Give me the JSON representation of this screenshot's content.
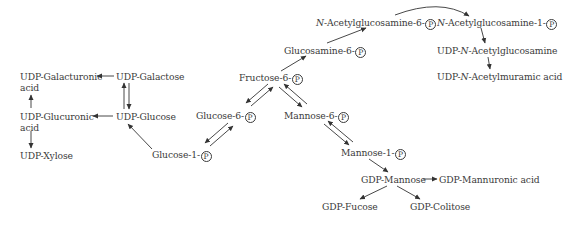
{
  "diagram": {
    "title": "",
    "phosphate_symbol": "P",
    "nodes": {
      "udp_galacturonic": {
        "line1": "UDP-Galacturonic",
        "line2": "acid"
      },
      "udp_galactose": {
        "text": "UDP-Galactose"
      },
      "udp_glucuronic": {
        "line1": "UDP-Glucuronic",
        "line2": "acid"
      },
      "udp_glucose": {
        "text": "UDP-Glucose"
      },
      "udp_xylose": {
        "text": "UDP-Xylose"
      },
      "glucose_1p": {
        "text": "Glucose-1-"
      },
      "glucose_6p": {
        "text": "Glucose-6-"
      },
      "fructose_6p": {
        "text": "Fructose-6-"
      },
      "mannose_6p": {
        "text": "Mannose-6-"
      },
      "mannose_1p": {
        "text": "Mannose-1-"
      },
      "glucosamine_6p": {
        "text": "Glucosamine-6-"
      },
      "nacetylglucosamine_6p": {
        "prefix": "N",
        "text": "-Acetylglucosamine-6-"
      },
      "nacetylglucosamine_1p": {
        "prefix": "N",
        "text": "-Acetylglucosamine-1-"
      },
      "udp_nacetylglucosamine": {
        "pre": "UDP-",
        "prefix": "N",
        "text": "-Acetylglucosamine"
      },
      "udp_nacetylmuramic": {
        "pre": "UDP-",
        "prefix": "N",
        "text": "-Acetylmuramic acid"
      },
      "gdp_mannose": {
        "text": "GDP-Mannose"
      },
      "gdp_mannuronic": {
        "text": "GDP-Mannuronic acid"
      },
      "gdp_fucose": {
        "text": "GDP-Fucose"
      },
      "gdp_colitose": {
        "text": "GDP-Colitose"
      }
    },
    "edges": [
      {
        "from": "udp_galactose",
        "to": "udp_galacturonic",
        "type": "irreversible"
      },
      {
        "from": "udp_glucose",
        "to": "udp_glucuronic",
        "type": "irreversible"
      },
      {
        "from": "udp_glucuronic",
        "to": "udp_galacturonic",
        "type": "irreversible"
      },
      {
        "from": "udp_glucuronic",
        "to": "udp_xylose",
        "type": "irreversible"
      },
      {
        "from": "udp_glucose",
        "to": "udp_galactose",
        "type": "reversible"
      },
      {
        "from": "glucose_1p",
        "to": "udp_glucose",
        "type": "irreversible"
      },
      {
        "from": "glucose_1p",
        "to": "glucose_6p",
        "type": "reversible"
      },
      {
        "from": "glucose_6p",
        "to": "fructose_6p",
        "type": "reversible"
      },
      {
        "from": "fructose_6p",
        "to": "mannose_6p",
        "type": "reversible"
      },
      {
        "from": "mannose_6p",
        "to": "mannose_1p",
        "type": "reversible"
      },
      {
        "from": "fructose_6p",
        "to": "glucosamine_6p",
        "type": "irreversible"
      },
      {
        "from": "glucosamine_6p",
        "to": "nacetylglucosamine_6p",
        "type": "irreversible"
      },
      {
        "from": "nacetylglucosamine_6p",
        "to": "nacetylglucosamine_1p",
        "type": "irreversible"
      },
      {
        "from": "nacetylglucosamine_1p",
        "to": "udp_nacetylglucosamine",
        "type": "irreversible"
      },
      {
        "from": "udp_nacetylglucosamine",
        "to": "udp_nacetylmuramic",
        "type": "irreversible"
      },
      {
        "from": "mannose_1p",
        "to": "gdp_mannose",
        "type": "irreversible"
      },
      {
        "from": "gdp_mannose",
        "to": "gdp_mannuronic",
        "type": "irreversible"
      },
      {
        "from": "gdp_mannose",
        "to": "gdp_fucose",
        "type": "irreversible"
      },
      {
        "from": "gdp_mannose",
        "to": "gdp_colitose",
        "type": "irreversible"
      }
    ]
  }
}
